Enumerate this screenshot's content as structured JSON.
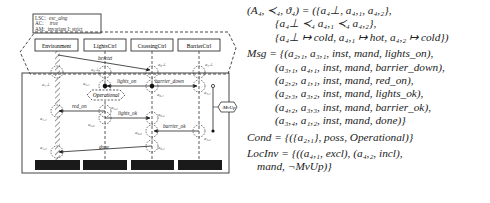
{
  "header_box": {
    "lines": [
      {
        "key": "LSC:",
        "value": "esc_alng"
      },
      {
        "key": "AC:",
        "value": "true"
      },
      {
        "key": "AM:",
        "value": "invariant   I: strict"
      }
    ]
  },
  "instances": [
    {
      "name": "Environment"
    },
    {
      "name": "LightsCtrl"
    },
    {
      "name": "CrossingCtrl"
    },
    {
      "name": "BarrierCtrl"
    }
  ],
  "messages": [
    {
      "label": "besetzt",
      "from": "Environment",
      "to": "CrossingCtrl"
    },
    {
      "label": "lights_on",
      "from": "CrossingCtrl",
      "to": "LightsCtrl"
    },
    {
      "label": "barrier_down",
      "from": "CrossingCtrl",
      "to": "BarrierCtrl"
    },
    {
      "label": "red_on",
      "from": "LightsCtrl",
      "to": "Environment"
    },
    {
      "label": "lights_ok",
      "from": "LightsCtrl",
      "to": "CrossingCtrl"
    },
    {
      "label": "barrier_ok",
      "from": "BarrierCtrl",
      "to": "CrossingCtrl"
    },
    {
      "label": "done",
      "from": "CrossingCtrl",
      "to": "Environment"
    }
  ],
  "locations": {
    "a1_top": "a₁⊥",
    "a2_top": "a₂⊥",
    "a3_top": "a₃⊥",
    "a4_top": "a₄⊥",
    "a11": "a₁,₁",
    "a12": "a₁,₂",
    "a21": "a₂,₁",
    "a22": "a₂,₂",
    "a23": "a₂,₃",
    "a31": "a₃,₁",
    "a32": "a₃,₂",
    "a33": "a₃,₃",
    "a34": "a₃,₄",
    "a41": "a₄,₁",
    "a42": "a₄,₂"
  },
  "condition_label": "Operational",
  "invariant_label": "¬MvUp",
  "formulas": {
    "a_line1": "(A₄, ≺₄, ϑ₄) = ({a₄⊥, a₄,₁, a₄,₂},",
    "a_line2": "{a₄⊥ ≺₄ a₄,₁ ≺₄ a₄,₂},",
    "a_line3": "{a₄⊥ ↦ cold, a₄,₁ ↦ hot, a₄,₂ ↦ cold})",
    "msg_line1": "Msg = {(a₂,₁, a₃,₁, inst, mand, lights_on),",
    "msg_line2": "(a₃,₁, a₄,₁, inst, mand, barrier_down),",
    "msg_line3": "(a₂,₂, a₁,₁, inst, mand, red_on),",
    "msg_line4": "(a₂,₃, a₃,₂, inst, mand, lights_ok),",
    "msg_line5": "(a₄,₂, a₃,₃, inst, mand, barrier_ok),",
    "msg_line6": "(a₃,₄, a₁,₂, inst, mand, done)}",
    "cond_line": "Cond = {({a₂,₁}, poss, Operational)}",
    "locinv_line1": "LocInv = {((a₄,₁, excl), (a₄,₂, incl),",
    "locinv_line2": "mand, ¬MvUp)}"
  }
}
